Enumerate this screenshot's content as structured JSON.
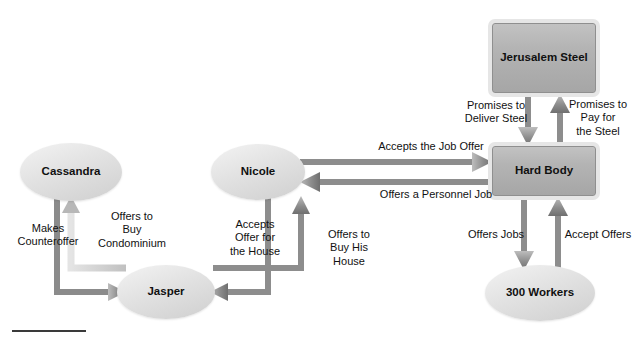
{
  "diagram": {
    "type": "relationship-flow-diagram",
    "background_color": "#ffffff",
    "nodes": [
      {
        "id": "cassandra",
        "label": "Cassandra",
        "shape": "ellipse",
        "fill": "#a3a3a3",
        "x": 24,
        "y": 147,
        "w": 94,
        "h": 50
      },
      {
        "id": "jasper",
        "label": "Jasper",
        "shape": "ellipse",
        "fill": "#a3a3a3",
        "x": 121,
        "y": 269,
        "w": 90,
        "h": 46
      },
      {
        "id": "nicole",
        "label": "Nicole",
        "shape": "ellipse",
        "fill": "#a3a3a3",
        "x": 215,
        "y": 148,
        "w": 86,
        "h": 48
      },
      {
        "id": "jerusalem_steel",
        "label": "Jerusalem\nSteel",
        "shape": "rect",
        "fill": "#b2b2b2",
        "x": 492,
        "y": 23,
        "w": 104,
        "h": 70
      },
      {
        "id": "hard_body",
        "label": "Hard Body",
        "shape": "rect",
        "fill": "#b2b2b2",
        "x": 492,
        "y": 146,
        "w": 104,
        "h": 50
      },
      {
        "id": "workers",
        "label": "300 Workers",
        "shape": "ellipse",
        "fill": "#d2d2d2",
        "x": 489,
        "y": 269,
        "w": 102,
        "h": 48
      }
    ],
    "edges": [
      {
        "id": "e-makes-counteroffer",
        "label": "Makes\nCounteroffer",
        "from": "cassandra",
        "to": "jasper",
        "label_x": 13,
        "label_y": 222,
        "label_w": 70
      },
      {
        "id": "e-offers-condominium",
        "label": "Offers to\nBuy\nCondominium",
        "from": "jasper",
        "to": "cassandra",
        "label_x": 90,
        "label_y": 210,
        "label_w": 84
      },
      {
        "id": "e-accepts-offer-house",
        "label": "Accepts\nOffer for\nthe House",
        "from": "jasper",
        "to": "nicole",
        "label_x": 224,
        "label_y": 218,
        "label_w": 62
      },
      {
        "id": "e-offers-buy-his-house",
        "label": "Offers to\nBuy His\nHouse",
        "from": "nicole",
        "to": "jasper",
        "label_x": 320,
        "label_y": 228,
        "label_w": 58
      },
      {
        "id": "e-accepts-job-offer",
        "label": "Accepts the Job Offer",
        "from": "nicole",
        "to": "hard_body",
        "label_x": 366,
        "label_y": 140,
        "label_w": 130
      },
      {
        "id": "e-offers-personnel-job",
        "label": "Offers a Personnel Job",
        "from": "hard_body",
        "to": "nicole",
        "label_x": 372,
        "label_y": 188,
        "label_w": 128
      },
      {
        "id": "e-promises-deliver-steel",
        "label": "Promises to\nDeliver Steel",
        "from": "jerusalem_steel",
        "to": "hard_body",
        "label_x": 455,
        "label_y": 99,
        "label_w": 82
      },
      {
        "id": "e-promises-pay-steel",
        "label": "Promises to\nPay for\nthe Steel",
        "from": "hard_body",
        "to": "jerusalem_steel",
        "label_x": 560,
        "label_y": 98,
        "label_w": 76
      },
      {
        "id": "e-offers-jobs",
        "label": "Offers Jobs",
        "from": "hard_body",
        "to": "workers",
        "label_x": 464,
        "label_y": 228,
        "label_w": 64
      },
      {
        "id": "e-accept-offers",
        "label": "Accept Offers",
        "from": "workers",
        "to": "hard_body",
        "label_x": 562,
        "label_y": 228,
        "label_w": 72
      }
    ],
    "footer_rule": {
      "x": 12,
      "y": 330,
      "w": 74,
      "color": "#3a3a3a"
    }
  }
}
